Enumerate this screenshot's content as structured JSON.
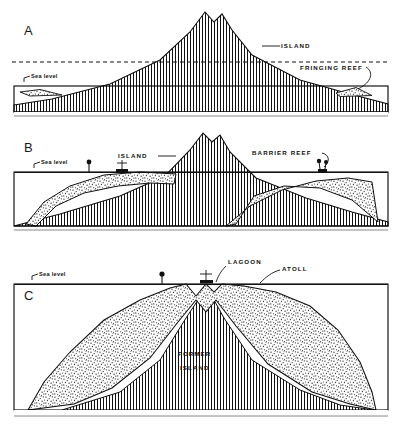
{
  "figure": {
    "panels": [
      {
        "letter": "A",
        "stage": "fringing-reef",
        "labels": {
          "sea_level": "Sea level",
          "island": "ISLAND",
          "reef": "FRINGING REEF"
        }
      },
      {
        "letter": "B",
        "stage": "barrier-reef",
        "labels": {
          "sea_level": "Sea level",
          "island": "ISLAND",
          "reef": "BARRIER REEF"
        }
      },
      {
        "letter": "C",
        "stage": "atoll",
        "labels": {
          "sea_level": "Sea level",
          "lagoon": "LAGOON",
          "reef": "ATOLL",
          "former_island_line1": "FORMER",
          "former_island_line2": "ISLAND"
        }
      }
    ],
    "colors": {
      "ink": "#111111",
      "background": "#ffffff",
      "frame": "#000000"
    }
  }
}
